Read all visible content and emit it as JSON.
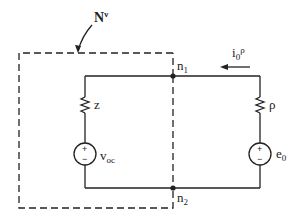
{
  "diagram": {
    "type": "circuit",
    "network_label": {
      "base": "N",
      "sup": "ν"
    },
    "nodes": [
      {
        "id": "n1",
        "base": "n",
        "sub": "1"
      },
      {
        "id": "n2",
        "base": "n",
        "sub": "2"
      }
    ],
    "left_branch": {
      "resistor": {
        "label": "z"
      },
      "source": {
        "base": "v",
        "sub": "oc",
        "plus": "+",
        "minus": "−"
      }
    },
    "right_branch": {
      "resistor": {
        "label": "ρ"
      },
      "source": {
        "base": "e",
        "sub": "0",
        "plus": "+",
        "minus": "−"
      }
    },
    "current": {
      "base": "i",
      "sub": "0",
      "sup": "ρ",
      "direction": "left"
    },
    "colors": {
      "ink": "#222222",
      "background": "#ffffff"
    }
  }
}
